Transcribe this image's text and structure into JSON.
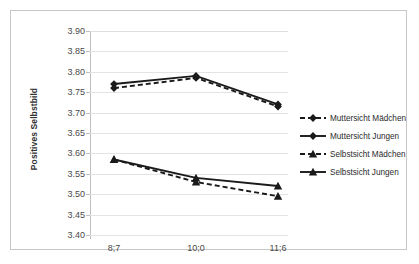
{
  "chart_data": {
    "type": "line",
    "title": "",
    "xlabel": "",
    "ylabel": "Positives Selbstbild",
    "categories": [
      "8;7",
      "10;0",
      "11;6"
    ],
    "ylim": [
      3.4,
      3.9
    ],
    "ytick_step": 0.05,
    "yticks": [
      "3.90",
      "3.85",
      "3.80",
      "3.75",
      "3.70",
      "3.65",
      "3.60",
      "3.55",
      "3.50",
      "3.45",
      "3.40"
    ],
    "ytick_values": [
      3.9,
      3.85,
      3.8,
      3.75,
      3.7,
      3.65,
      3.6,
      3.55,
      3.5,
      3.45,
      3.4
    ],
    "grid": true,
    "legend_position": "right",
    "series": [
      {
        "name": "Muttersicht Mädchen",
        "values": [
          3.76,
          3.785,
          3.715
        ],
        "style": "dashed",
        "marker": "diamond",
        "color": "#1a1a1a"
      },
      {
        "name": "Muttersicht Jungen",
        "values": [
          3.77,
          3.79,
          3.72
        ],
        "style": "solid",
        "marker": "diamond",
        "color": "#1a1a1a"
      },
      {
        "name": "Selbstsicht Mädchen",
        "values": [
          3.585,
          3.53,
          3.495
        ],
        "style": "dashed",
        "marker": "triangle",
        "color": "#1a1a1a"
      },
      {
        "name": "Selbstsicht Jungen",
        "values": [
          3.585,
          3.54,
          3.52
        ],
        "style": "solid",
        "marker": "triangle",
        "color": "#1a1a1a"
      }
    ]
  },
  "legend": {
    "items": [
      {
        "label": "Muttersicht Mädchen"
      },
      {
        "label": "Muttersicht Jungen"
      },
      {
        "label": "Selbstsicht Mädchen"
      },
      {
        "label": "Selbstsicht Jungen"
      }
    ]
  }
}
